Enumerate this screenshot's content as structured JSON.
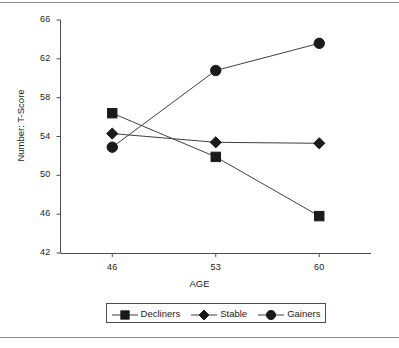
{
  "chart_data": {
    "type": "line",
    "title": "",
    "subtitle": "",
    "xlabel": "AGE",
    "ylabel": "Number: T-Score",
    "categories": [
      46,
      53,
      60
    ],
    "x": [
      46,
      53,
      60
    ],
    "xtick_labels": [
      "46",
      "53",
      "60"
    ],
    "ytick_labels": [
      "42",
      "46",
      "50",
      "54",
      "58",
      "62",
      "66"
    ],
    "yticks": [
      42,
      46,
      50,
      54,
      58,
      62,
      66
    ],
    "xlim": [
      42.5,
      63.5
    ],
    "ylim": [
      42,
      66
    ],
    "grid": false,
    "legend_position": "bottom",
    "line_color": "#3f3f3f",
    "marker_color": "#1a1a1a",
    "series": [
      {
        "name": "Decliners",
        "marker": "square",
        "values": [
          56.4,
          51.9,
          45.8
        ]
      },
      {
        "name": "Stable",
        "marker": "diamond",
        "values": [
          54.3,
          53.4,
          53.3
        ]
      },
      {
        "name": "Gainers",
        "marker": "circle",
        "values": [
          52.9,
          60.8,
          63.6
        ]
      }
    ]
  },
  "legend": {
    "entries": [
      {
        "label": "Decliners",
        "marker": "square"
      },
      {
        "label": "Stable",
        "marker": "diamond"
      },
      {
        "label": "Gainers",
        "marker": "circle"
      }
    ]
  },
  "axes": {
    "y_label": "Number: T-Score",
    "x_label": "AGE",
    "y_ticks": [
      "66",
      "62",
      "58",
      "54",
      "50",
      "46",
      "42"
    ],
    "x_ticks": [
      "46",
      "53",
      "60"
    ]
  }
}
